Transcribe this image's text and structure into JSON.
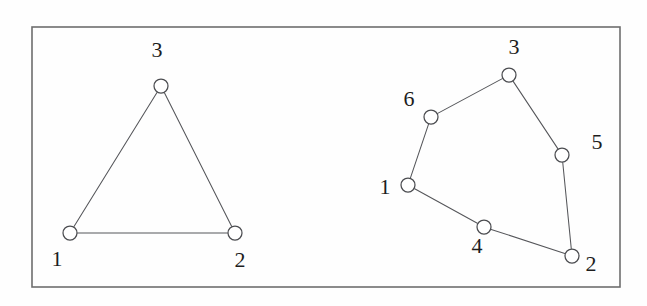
{
  "figure": {
    "background_color": "#fefefe",
    "frame": {
      "name": "figure-border",
      "x": 32,
      "y": 27,
      "width": 588,
      "height": 260,
      "stroke_color": "#6e6e6e",
      "stroke_width": 1.6
    },
    "style": {
      "edge_color": "#55565a",
      "node_fill": "#ffffff",
      "node_stroke": "#4b4c50",
      "node_radius": 7,
      "label_color": "#1d1d1d",
      "label_font_size": 22
    },
    "graphs": [
      {
        "id": "left-graph",
        "name": "triangle-graph",
        "description": "3-node complete graph (triangle)",
        "node_count": 3,
        "edge_count": 3,
        "nodes": [
          {
            "id": "1",
            "label": "1",
            "cx": 70,
            "cy": 233,
            "label_x": 57,
            "label_y": 259
          },
          {
            "id": "2",
            "label": "2",
            "cx": 235,
            "cy": 233,
            "label_x": 240,
            "label_y": 260
          },
          {
            "id": "3",
            "label": "3",
            "cx": 161,
            "cy": 86,
            "label_x": 157,
            "label_y": 50
          }
        ],
        "edges": [
          {
            "from": "1",
            "to": "3"
          },
          {
            "from": "3",
            "to": "2"
          },
          {
            "from": "1",
            "to": "2"
          }
        ]
      },
      {
        "id": "right-graph",
        "name": "hexagon-cycle-graph",
        "description": "6-node cycle graph",
        "node_count": 6,
        "edge_count": 6,
        "nodes": [
          {
            "id": "1",
            "label": "1",
            "cx": 408,
            "cy": 185,
            "label_x": 385,
            "label_y": 187
          },
          {
            "id": "2",
            "label": "2",
            "cx": 572,
            "cy": 256,
            "label_x": 591,
            "label_y": 264
          },
          {
            "id": "3",
            "label": "3",
            "cx": 509,
            "cy": 75,
            "label_x": 514,
            "label_y": 47
          },
          {
            "id": "4",
            "label": "4",
            "cx": 484,
            "cy": 227,
            "label_x": 477,
            "label_y": 246
          },
          {
            "id": "5",
            "label": "5",
            "cx": 562,
            "cy": 155,
            "label_x": 597,
            "label_y": 142
          },
          {
            "id": "6",
            "label": "6",
            "cx": 431,
            "cy": 117,
            "label_x": 409,
            "label_y": 99
          }
        ],
        "edges": [
          {
            "from": "1",
            "to": "6"
          },
          {
            "from": "6",
            "to": "3"
          },
          {
            "from": "3",
            "to": "5"
          },
          {
            "from": "5",
            "to": "2"
          },
          {
            "from": "2",
            "to": "4"
          },
          {
            "from": "4",
            "to": "1"
          }
        ]
      }
    ]
  }
}
